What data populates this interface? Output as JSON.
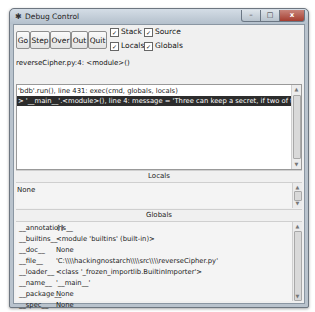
{
  "window": {
    "title": "Debug Control",
    "icons": {
      "app": "bug-icon",
      "minimize": "minimize-icon",
      "maximize": "maximize-icon",
      "close": "close-icon"
    }
  },
  "toolbar": {
    "buttons": [
      {
        "label": "Go"
      },
      {
        "label": "Step"
      },
      {
        "label": "Over"
      },
      {
        "label": "Out"
      },
      {
        "label": "Quit"
      }
    ],
    "checkboxes": [
      {
        "label": "Stack",
        "checked": true
      },
      {
        "label": "Source",
        "checked": true
      },
      {
        "label": "Locals",
        "checked": true
      },
      {
        "label": "Globals",
        "checked": true
      }
    ],
    "check_glyph": "✓"
  },
  "status": "reverseCipher.py:4: <module>()",
  "stack": {
    "rows": [
      {
        "text": "'bdb'.run(), line 431: exec(cmd, globals, locals)",
        "selected": false
      },
      {
        "text": "> '__main__'.<module>(), line 4: message = 'Three can keep a secret, if two of them are dead.'",
        "selected": true
      }
    ]
  },
  "locals": {
    "header": "Locals",
    "value": "None"
  },
  "globals": {
    "header": "Globals",
    "rows": [
      {
        "name": "__annotations__",
        "value": "{}"
      },
      {
        "name": "__builtins__",
        "value": "<module 'builtins' (built-in)>"
      },
      {
        "name": "__doc__",
        "value": "None"
      },
      {
        "name": "__file__",
        "value": "'C:\\\\\\\\hackingnostarch\\\\\\\\src\\\\\\\\reverseCipher.py'"
      },
      {
        "name": "__loader__",
        "value": "<class '_frozen_importlib.BuiltinImporter'>"
      },
      {
        "name": "__name__",
        "value": "'__main__'"
      },
      {
        "name": "__package__",
        "value": "None"
      },
      {
        "name": "__spec__",
        "value": "None"
      }
    ]
  },
  "scroll_glyphs": {
    "up": "▲",
    "down": "▼"
  }
}
